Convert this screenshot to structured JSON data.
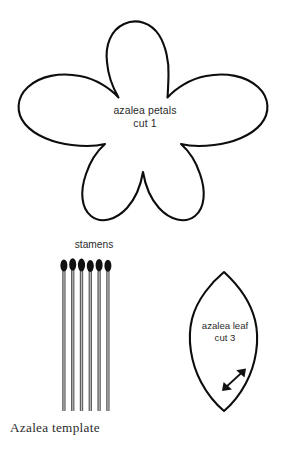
{
  "document": {
    "caption": "Azalea template",
    "background_color": "#ffffff",
    "ink_color": "#0d0d0d"
  },
  "pieces": {
    "petals": {
      "name": "azalea-petals",
      "label_line1": "azalea petals",
      "label_line2": "cut 1",
      "shape": "five-lobed-flower",
      "petal_count": 5
    },
    "stamens": {
      "name": "stamens",
      "label": "stamens",
      "count": 6,
      "head_color": "#121212",
      "stem_color": "#5e5e5e"
    },
    "leaf": {
      "name": "azalea-leaf",
      "label_line1": "azalea leaf",
      "label_line2": "cut 3",
      "shape": "pointed-oval-leaf",
      "grain_marker": "double-headed-arrow"
    }
  }
}
